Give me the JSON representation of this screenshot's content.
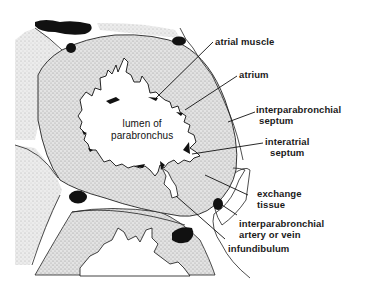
{
  "figure": {
    "type": "anatomical cross-section diagram"
  },
  "center_label": {
    "line1": "lumen of",
    "line2": "parabronchus"
  },
  "labels": [
    {
      "id": "atrial-muscle",
      "line1": "atrial muscle",
      "line2": ""
    },
    {
      "id": "atrium",
      "line1": "atrium",
      "line2": ""
    },
    {
      "id": "interparabronchial-septum",
      "line1": "interparabronchial",
      "line2": "septum"
    },
    {
      "id": "interatrial-septum",
      "line1": "interatrial",
      "line2": "septum"
    },
    {
      "id": "exchange-tissue",
      "line1": "exchange",
      "line2": "tissue"
    },
    {
      "id": "interparabronchial-artery",
      "line1": "interparabronchial",
      "line2": "artery or vein"
    },
    {
      "id": "infundibulum",
      "line1": "infundibulum",
      "line2": ""
    }
  ],
  "caption": "",
  "colors": {
    "ink": "#111111",
    "stipple_bg": "#d9d9d9",
    "background": "#ffffff"
  }
}
